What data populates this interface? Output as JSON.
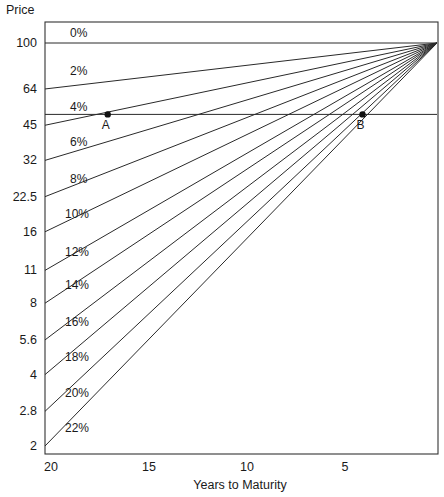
{
  "chart_data": {
    "type": "line",
    "title": "",
    "xlabel": "Years to Maturity",
    "ylabel": "Price",
    "x_scale": "linear",
    "y_scale": "log",
    "xlim": [
      20,
      0
    ],
    "ylim_ticks": [
      2,
      100
    ],
    "x_ticks": [
      20,
      15,
      10,
      5
    ],
    "x_tick_labels": [
      "20",
      "15",
      "10",
      "5"
    ],
    "y_ticks": [
      100,
      64,
      45,
      32,
      22.5,
      16,
      11,
      8,
      5.6,
      4,
      2.8,
      2
    ],
    "y_tick_labels": [
      "100",
      "64",
      "45",
      "32",
      "22.5",
      "16",
      "11",
      "8",
      "5.6",
      "4",
      "2.8",
      "2"
    ],
    "grid": false,
    "series": [
      {
        "name": "0%",
        "start": {
          "years": 20,
          "price": 100
        },
        "end": {
          "years": 0,
          "price": 100
        }
      },
      {
        "name": "2%",
        "start": {
          "years": 20,
          "price": 64
        },
        "end": {
          "years": 0,
          "price": 100
        }
      },
      {
        "name": "4%",
        "start": {
          "years": 20,
          "price": 45
        },
        "end": {
          "years": 0,
          "price": 100
        }
      },
      {
        "name": "6%",
        "start": {
          "years": 20,
          "price": 32
        },
        "end": {
          "years": 0,
          "price": 100
        }
      },
      {
        "name": "8%",
        "start": {
          "years": 20,
          "price": 22.5
        },
        "end": {
          "years": 0,
          "price": 100
        }
      },
      {
        "name": "10%",
        "start": {
          "years": 20,
          "price": 16
        },
        "end": {
          "years": 0,
          "price": 100
        }
      },
      {
        "name": "12%",
        "start": {
          "years": 20,
          "price": 11
        },
        "end": {
          "years": 0,
          "price": 100
        }
      },
      {
        "name": "14%",
        "start": {
          "years": 20,
          "price": 8
        },
        "end": {
          "years": 0,
          "price": 100
        }
      },
      {
        "name": "16%",
        "start": {
          "years": 20,
          "price": 5.6
        },
        "end": {
          "years": 0,
          "price": 100
        }
      },
      {
        "name": "18%",
        "start": {
          "years": 20,
          "price": 4
        },
        "end": {
          "years": 0,
          "price": 100
        }
      },
      {
        "name": "20%",
        "start": {
          "years": 20,
          "price": 2.8
        },
        "end": {
          "years": 0,
          "price": 100
        }
      },
      {
        "name": "22%",
        "start": {
          "years": 20,
          "price": 2
        },
        "end": {
          "years": 0,
          "price": 100
        }
      }
    ],
    "series_label_years": [
      16.8,
      16.8,
      16.8,
      16.8,
      16.8,
      17.0,
      17.0,
      17.0,
      17.0,
      17.0,
      17.0,
      17.0
    ],
    "reference_line": {
      "price": 50,
      "label": ""
    },
    "points": [
      {
        "label": "A",
        "years": 16.8,
        "price": 50
      },
      {
        "label": "B",
        "years": 3.8,
        "price": 50
      }
    ],
    "legend": "inline"
  }
}
